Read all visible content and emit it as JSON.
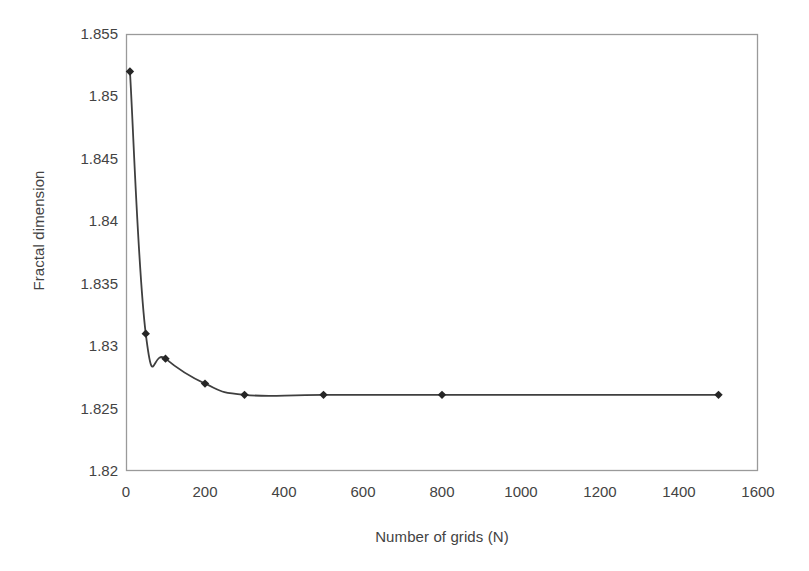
{
  "chart_data": {
    "type": "line",
    "title": "",
    "xlabel": "Number of grids (N)",
    "ylabel": "Fractal dimension",
    "xlim": [
      0,
      1600
    ],
    "ylim": [
      1.82,
      1.855
    ],
    "xticks": [
      0,
      200,
      400,
      600,
      800,
      1000,
      1200,
      1400,
      1600
    ],
    "xtick_labels": [
      "0",
      "200",
      "400",
      "600",
      "800",
      "1000",
      "1200",
      "1400",
      "1600"
    ],
    "yticks": [
      1.82,
      1.825,
      1.83,
      1.835,
      1.84,
      1.845,
      1.85,
      1.855
    ],
    "ytick_labels": [
      "1.82",
      "1.825",
      "1.83",
      "1.835",
      "1.84",
      "1.845",
      "1.85",
      "1.855"
    ],
    "grid": false,
    "legend": null,
    "legend_position": "none",
    "marker": "diamond",
    "line_color": "#3f3f3f",
    "marker_color": "#262626",
    "plot_border_color": "#9a9a9a",
    "background_color": "#ffffff",
    "series": [
      {
        "name": "Fractal dimension vs number of grids",
        "x": [
          10,
          50,
          100,
          200,
          300,
          500,
          800,
          1500
        ],
        "values": [
          1.852,
          1.831,
          1.829,
          1.827,
          1.8261,
          1.8261,
          1.8261,
          1.8261
        ]
      }
    ]
  }
}
